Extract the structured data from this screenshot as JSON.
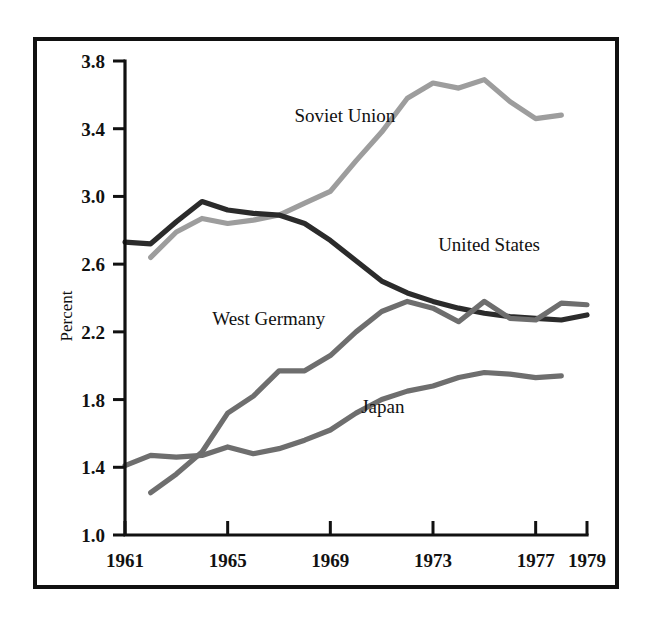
{
  "figure": {
    "background_color": "#ffffff",
    "frame_color": "#111111"
  },
  "chart_data": {
    "type": "line",
    "title": "",
    "subtitle": "",
    "xlabel": "",
    "ylabel": "Percent",
    "xlim": [
      1961,
      1979
    ],
    "ylim": [
      1.0,
      3.8
    ],
    "xticks": [
      1961,
      1965,
      1969,
      1973,
      1977,
      1979
    ],
    "xtick_labels": [
      "1961",
      "1965",
      "1969",
      "1973",
      "1977",
      "1979"
    ],
    "yticks": [
      1.0,
      1.4,
      1.8,
      2.2,
      2.6,
      3.0,
      3.4,
      3.8
    ],
    "ytick_labels": [
      "1.0",
      "1.4",
      "1.8",
      "2.2",
      "2.6",
      "3.0",
      "3.4",
      "3.8"
    ],
    "grid": false,
    "legend": "inline-labels",
    "series": [
      {
        "name": "Soviet Union",
        "color": "#9d9d9d",
        "label_x": 1967.6,
        "label_y": 3.44,
        "x": [
          1962,
          1963,
          1964,
          1965,
          1966,
          1967,
          1968,
          1969,
          1970,
          1971,
          1972,
          1973,
          1974,
          1975,
          1976,
          1977,
          1978
        ],
        "values": [
          2.64,
          2.79,
          2.87,
          2.84,
          2.86,
          2.89,
          2.96,
          3.03,
          3.21,
          3.38,
          3.58,
          3.67,
          3.64,
          3.69,
          3.56,
          3.46,
          3.48
        ]
      },
      {
        "name": "United States",
        "color": "#2b2b2b",
        "label_x": 1973.2,
        "label_y": 2.68,
        "x": [
          1961,
          1962,
          1963,
          1964,
          1965,
          1966,
          1967,
          1968,
          1969,
          1970,
          1971,
          1972,
          1973,
          1974,
          1975,
          1976,
          1977,
          1978,
          1979
        ],
        "values": [
          2.73,
          2.72,
          2.85,
          2.97,
          2.92,
          2.9,
          2.89,
          2.84,
          2.74,
          2.62,
          2.5,
          2.43,
          2.38,
          2.34,
          2.31,
          2.29,
          2.28,
          2.27,
          2.3
        ]
      },
      {
        "name": "West Germany",
        "color": "#6e6e6e",
        "label_x": 1964.4,
        "label_y": 2.24,
        "x": [
          1962,
          1963,
          1964,
          1965,
          1966,
          1967,
          1968,
          1969,
          1970,
          1971,
          1972,
          1973,
          1974,
          1975,
          1976,
          1977,
          1978,
          1979
        ],
        "values": [
          1.25,
          1.36,
          1.49,
          1.72,
          1.82,
          1.97,
          1.97,
          2.06,
          2.2,
          2.32,
          2.38,
          2.34,
          2.26,
          2.38,
          2.28,
          2.27,
          2.37,
          2.36
        ]
      },
      {
        "name": "Japan",
        "color": "#6e6e6e",
        "label_x": 1970.2,
        "label_y": 1.72,
        "x": [
          1961,
          1962,
          1963,
          1964,
          1965,
          1966,
          1967,
          1968,
          1969,
          1970,
          1971,
          1972,
          1973,
          1974,
          1975,
          1976,
          1977,
          1978
        ],
        "values": [
          1.41,
          1.47,
          1.46,
          1.47,
          1.52,
          1.48,
          1.51,
          1.56,
          1.62,
          1.72,
          1.8,
          1.85,
          1.88,
          1.93,
          1.96,
          1.95,
          1.93,
          1.94
        ]
      }
    ]
  }
}
